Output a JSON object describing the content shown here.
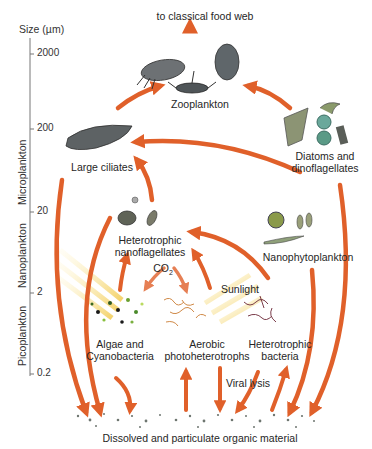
{
  "diagram": {
    "title_top": "to classical food web",
    "axis": {
      "title": "Size (µm)",
      "ticks": [
        "2000",
        "200",
        "20",
        "2",
        "0.2"
      ],
      "bands": [
        "Microplankton",
        "Nanoplankton",
        "Picoplankton"
      ]
    },
    "nodes": {
      "zooplankton": "Zooplankton",
      "large_ciliates": "Large ciliates",
      "diatoms_line1": "Diatoms and",
      "diatoms_line2": "dinoflagellates",
      "het_nano_line1": "Heterotrophic",
      "het_nano_line2": "nanoflagellates",
      "nanophyto": "Nanophytoplankton",
      "algae_line1": "Algae and",
      "algae_line2": "Cyanobacteria",
      "aerobic_line1": "Aerobic",
      "aerobic_line2": "photoheterotrophs",
      "het_bact_line1": "Heterotrophic",
      "het_bact_line2": "bacteria",
      "dom": "Dissolved and particulate organic material"
    },
    "annotations": {
      "co2": "CO",
      "co2_sub": "2",
      "sunlight": "Sunlight",
      "viral_lysis": "Viral lysis"
    },
    "colors": {
      "arrow": "#e0602a",
      "arrow_dark": "#c94a1c",
      "sunlight": "#f5d860",
      "axis": "#666666"
    }
  }
}
